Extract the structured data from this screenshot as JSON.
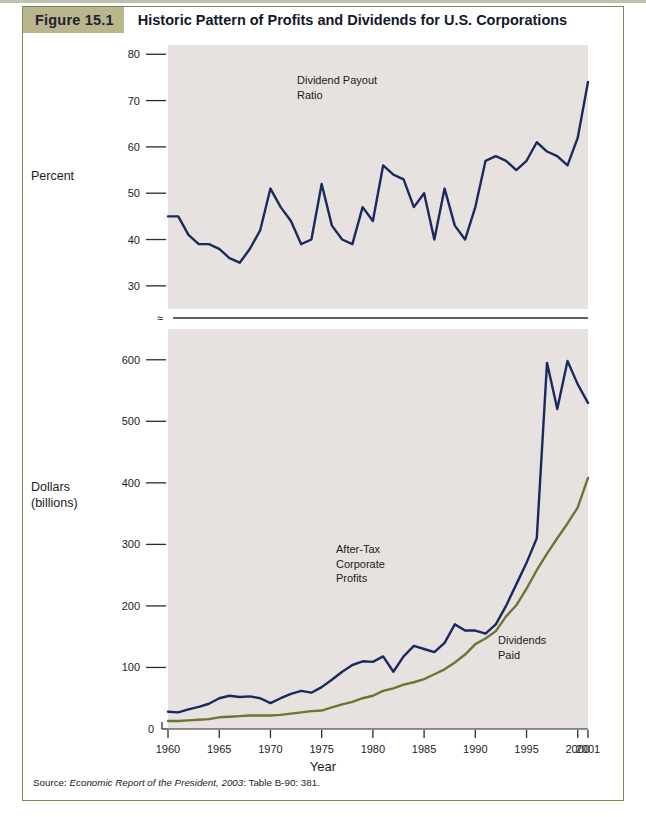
{
  "figure": {
    "tag": "Figure 15.1",
    "title": "Historic Pattern of Profits and Dividends for U.S. Corporations",
    "source_label": "Source: ",
    "source_reference": "Economic Report of the President, 2003",
    "source_tail": ": Table B-90: 381."
  },
  "axes": {
    "top_axis_label": "Percent",
    "bottom_axis_label_line1": "Dollars",
    "bottom_axis_label_line2": "(billions)",
    "x_title": "Year",
    "break_symbol": "≈"
  },
  "annotations": {
    "payout": "Dividend Payout\nRatio",
    "profits": "After-Tax\nCorporate\nProfits",
    "dividends": "Dividends\nPaid"
  },
  "colors": {
    "navy": "#1b2a5e",
    "olive": "#6e7432",
    "plot_bg": "#e7e2df",
    "frame": "#7d8a55",
    "tag_bg": "#b9b58c",
    "axis": "#2b2b2b"
  },
  "chart_data": [
    {
      "type": "line",
      "title": "Dividend Payout Ratio",
      "xlabel": "Year",
      "ylabel": "Percent",
      "ylim": [
        25,
        82
      ],
      "yticks": [
        30,
        40,
        50,
        60,
        70,
        80
      ],
      "xlim": [
        1960,
        2001
      ],
      "xticks": [
        1960,
        1965,
        1970,
        1975,
        1980,
        1985,
        1990,
        1995,
        2000,
        2001
      ],
      "grid": false,
      "legend": "none",
      "series": [
        {
          "name": "Dividend Payout Ratio",
          "color": "#1b2a5e",
          "x": [
            1960,
            1961,
            1962,
            1963,
            1964,
            1965,
            1966,
            1967,
            1968,
            1969,
            1970,
            1971,
            1972,
            1973,
            1974,
            1975,
            1976,
            1977,
            1978,
            1979,
            1980,
            1981,
            1982,
            1983,
            1984,
            1985,
            1986,
            1987,
            1988,
            1989,
            1990,
            1991,
            1992,
            1993,
            1994,
            1995,
            1996,
            1997,
            1998,
            1999,
            2000,
            2001
          ],
          "values": [
            45,
            45,
            41,
            39,
            39,
            38,
            36,
            35,
            38,
            42,
            51,
            47,
            44,
            39,
            40,
            52,
            43,
            40,
            39,
            47,
            44,
            56,
            54,
            53,
            47,
            50,
            40,
            51,
            43,
            40,
            47,
            57,
            58,
            57,
            55,
            57,
            61,
            59,
            58,
            56,
            62,
            74
          ]
        }
      ]
    },
    {
      "type": "line",
      "title": "After-Tax Corporate Profits and Dividends Paid",
      "xlabel": "Year",
      "ylabel": "Dollars (billions)",
      "ylim": [
        0,
        650
      ],
      "yticks": [
        0,
        100,
        200,
        300,
        400,
        500,
        600
      ],
      "xlim": [
        1960,
        2001
      ],
      "xticks": [
        1960,
        1965,
        1970,
        1975,
        1980,
        1985,
        1990,
        1995,
        2000,
        2001
      ],
      "grid": false,
      "legend": "in-plot labels",
      "series": [
        {
          "name": "After-Tax Corporate Profits",
          "color": "#1b2a5e",
          "x": [
            1960,
            1961,
            1962,
            1963,
            1964,
            1965,
            1966,
            1967,
            1968,
            1969,
            1970,
            1971,
            1972,
            1973,
            1974,
            1975,
            1976,
            1977,
            1978,
            1979,
            1980,
            1981,
            1982,
            1983,
            1984,
            1985,
            1986,
            1987,
            1988,
            1989,
            1990,
            1991,
            1992,
            1993,
            1994,
            1995,
            1996,
            1997,
            1998,
            1999,
            2000,
            2001
          ],
          "values": [
            28,
            27,
            32,
            36,
            41,
            50,
            54,
            52,
            53,
            50,
            42,
            50,
            57,
            62,
            59,
            68,
            80,
            93,
            104,
            110,
            109,
            118,
            93,
            118,
            135,
            130,
            125,
            140,
            170,
            160,
            160,
            155,
            170,
            200,
            235,
            270,
            310,
            350,
            360,
            400,
            450,
            530
          ]
        },
        {
          "name": "Dividends Paid",
          "color": "#6e7432",
          "x": [
            1960,
            1961,
            1962,
            1963,
            1964,
            1965,
            1966,
            1967,
            1968,
            1969,
            1970,
            1971,
            1972,
            1973,
            1974,
            1975,
            1976,
            1977,
            1978,
            1979,
            1980,
            1981,
            1982,
            1983,
            1984,
            1985,
            1986,
            1987,
            1988,
            1989,
            1990,
            1991,
            1992,
            1993,
            1994,
            1995,
            1996,
            1997,
            1998,
            1999,
            2000,
            2001
          ],
          "values": [
            13,
            13,
            14,
            15,
            16,
            19,
            20,
            21,
            22,
            22,
            22,
            23,
            25,
            27,
            29,
            30,
            35,
            40,
            44,
            50,
            54,
            62,
            66,
            72,
            76,
            81,
            89,
            97,
            108,
            121,
            138,
            147,
            159,
            183,
            201,
            228,
            258,
            285,
            310,
            334,
            360,
            395
          ]
        }
      ]
    }
  ],
  "chart_overrides": {
    "top_peak_2001": 74,
    "bottom_profit_peaks": {
      "1997": 595,
      "1999": 598,
      "2001": 530
    },
    "bottom_dividends_2001": 408
  }
}
